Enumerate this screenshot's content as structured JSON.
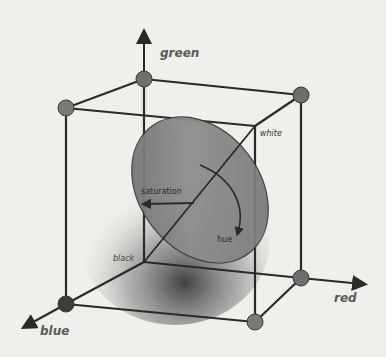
{
  "diagram": {
    "axes": {
      "green": "green",
      "red": "red",
      "blue": "blue"
    },
    "corners": {
      "white": "white",
      "black": "black"
    },
    "disc": {
      "saturation": "saturation",
      "hue": "hue"
    },
    "colors": {
      "background": "#efefec",
      "edge": "#2a2a2a",
      "vertex": "#6e6e6e",
      "vertex_dark": "#3c3c3c",
      "disc": "#7c7c7c"
    }
  }
}
